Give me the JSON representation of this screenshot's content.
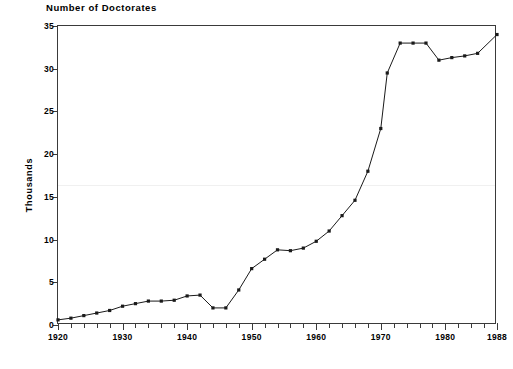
{
  "chart_data": {
    "type": "line",
    "title": "Number of Doctorates",
    "xlabel": "Year",
    "ylabel": "Thousands",
    "xlim": [
      1920,
      1988
    ],
    "ylim": [
      0,
      35
    ],
    "grid": false,
    "legend": false,
    "marker": "square",
    "line_color": "#1a1a1a",
    "x": [
      1920,
      1922,
      1924,
      1926,
      1928,
      1930,
      1932,
      1934,
      1936,
      1938,
      1940,
      1942,
      1944,
      1946,
      1948,
      1950,
      1952,
      1954,
      1956,
      1958,
      1960,
      1962,
      1964,
      1966,
      1968,
      1970,
      1971,
      1973,
      1975,
      1977,
      1979,
      1981,
      1983,
      1985,
      1988
    ],
    "values": [
      0.6,
      0.8,
      1.1,
      1.4,
      1.7,
      2.2,
      2.5,
      2.8,
      2.8,
      2.9,
      3.4,
      3.5,
      2.0,
      2.0,
      4.1,
      6.6,
      7.7,
      8.8,
      8.7,
      9.0,
      9.8,
      11.0,
      12.8,
      14.6,
      18.0,
      23.0,
      29.5,
      33.0,
      33.0,
      33.0,
      31.0,
      31.3,
      31.5,
      31.8,
      34.0
    ],
    "y_ticks": [
      0,
      5,
      10,
      15,
      20,
      25,
      30,
      35
    ],
    "y_tick_labels": [
      "0",
      "5",
      "10",
      "15",
      "20",
      "25",
      "30",
      "35"
    ],
    "x_major_ticks": [
      1920,
      1930,
      1940,
      1950,
      1960,
      1970,
      1980,
      1988
    ],
    "x_major_labels": [
      "1920",
      "1930",
      "1940",
      "1950",
      "1960",
      "1970",
      "1980",
      "1988"
    ],
    "x_minor_tick_interval": 2
  }
}
